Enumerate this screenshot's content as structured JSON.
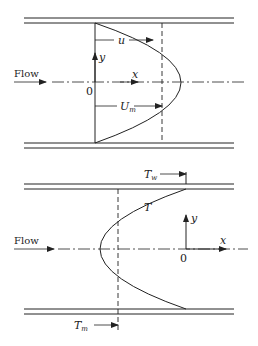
{
  "diagram_top": {
    "title": "Velocity profile",
    "flow_label": "Flow",
    "labels": {
      "u": "u",
      "y": "y",
      "x": "x",
      "origin": "0",
      "Um_main": "U",
      "Um_sub": "m"
    }
  },
  "diagram_bottom": {
    "title": "Temperature profile",
    "flow_label": "Flow",
    "labels": {
      "Tw_main": "T",
      "Tw_sub": "w",
      "T": "T",
      "y": "y",
      "x": "x",
      "origin": "0",
      "Tm_main": "T",
      "Tm_sub": "m"
    }
  },
  "colors": {
    "line": "#222222",
    "background": "#ffffff"
  }
}
